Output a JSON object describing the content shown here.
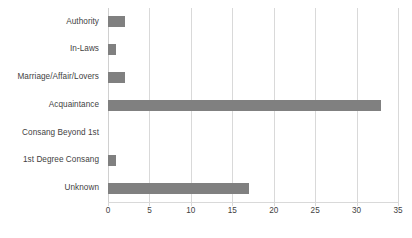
{
  "chart_data": {
    "type": "bar",
    "orientation": "horizontal",
    "title": "",
    "subtitle": "",
    "xlabel": "",
    "ylabel": "",
    "categories": [
      "Authority",
      "In-Laws",
      "Marriage/Affair/Lovers",
      "Acquaintance",
      "Consang Beyond 1st",
      "1st Degree Consang",
      "Unknown"
    ],
    "values": [
      2,
      1,
      2,
      33,
      0,
      1,
      17
    ],
    "series": [
      {
        "name": "",
        "values": [
          2,
          1,
          2,
          33,
          0,
          1,
          17
        ]
      }
    ],
    "xlim": [
      0,
      35
    ],
    "x_ticks": [
      0,
      5,
      10,
      15,
      20,
      25,
      30,
      35
    ],
    "x_tick_labels": [
      "0",
      "5",
      "10",
      "15",
      "20",
      "25",
      "30",
      "35"
    ],
    "grid": "vertical",
    "legend": "none",
    "bar_color": "#808080",
    "gridline_color": "#d9d9d9",
    "text_color": "#3f3f3f",
    "background_color": "#ffffff"
  }
}
